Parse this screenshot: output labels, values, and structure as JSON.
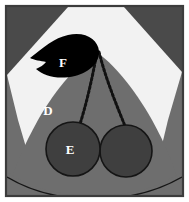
{
  "figure": {
    "type": "labeled-illustration",
    "canvas": {
      "width": 189,
      "height": 202
    },
    "colors": {
      "page_background": "#ffffff",
      "frame_border": "#3c3c3c",
      "corner_wedge": "#4a4a4a",
      "sky_background": "#f2f2f2",
      "body_gray": "#6e6e6e",
      "cherry_fill": "#3f3f3f",
      "cherry_outline": "#151515",
      "leaf_fill": "#000000",
      "stem_color": "#111111",
      "label_text": "#ffffff"
    },
    "labels": [
      {
        "id": "label-d",
        "text": "D",
        "x": 48,
        "y": 110,
        "target": "body-gray-region"
      },
      {
        "id": "label-e",
        "text": "E",
        "x": 70,
        "y": 149,
        "target": "left-cherry-circle"
      },
      {
        "id": "label-f",
        "text": "F",
        "x": 63,
        "y": 62,
        "target": "leaf-shape"
      }
    ],
    "shapes": {
      "frame": {
        "name": "outer-frame",
        "x": 5,
        "y": 5,
        "width": 179,
        "height": 192
      },
      "left_cherry": {
        "name": "left-cherry-circle",
        "cx": 73,
        "cy": 149,
        "r": 27
      },
      "right_cherry": {
        "name": "right-cherry-circle",
        "cx": 126,
        "cy": 151,
        "r": 26
      },
      "leaf": {
        "name": "leaf-shape",
        "tip_x": 30,
        "tip_y": 58
      },
      "stems": [
        {
          "name": "stem-left",
          "style": "dotted"
        },
        {
          "name": "stem-right",
          "style": "dotted"
        }
      ]
    }
  }
}
